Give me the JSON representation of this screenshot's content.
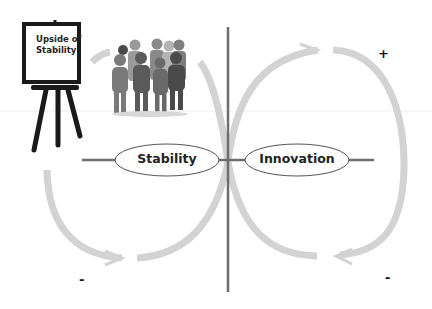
{
  "diagram": {
    "type": "polarity-map",
    "easel_sign": {
      "line1": "Upside of",
      "line2": "Stability"
    },
    "poles": [
      {
        "id": "stability",
        "label": "Stability"
      },
      {
        "id": "innovation",
        "label": "Innovation"
      }
    ],
    "signs": {
      "top_right": "+",
      "bottom_left": "-",
      "bottom_right": "-"
    },
    "colors": {
      "loop_arrows": "#d0d0d0",
      "axis_lines": "#6e6e6e",
      "ellipse_stroke": "#555555",
      "text": "#222222",
      "easel": "#1a1a1a"
    }
  }
}
